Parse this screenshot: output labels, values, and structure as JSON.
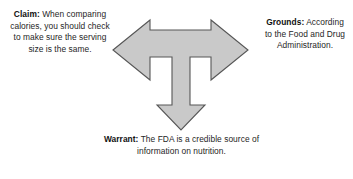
{
  "diagram": {
    "background_color": "#ffffff",
    "arrow": {
      "name": "tri-directional-t-arrow",
      "fill_color": "#c9c9c9",
      "stroke_color": "#565656",
      "directions": [
        "left",
        "right",
        "down"
      ]
    },
    "nodes": {
      "claim": {
        "label": "Claim:",
        "text": " When comparing calories, you should check to make sure the serving size is the same.",
        "full": "Claim: When comparing calories, you should check to make sure the serving size is the same."
      },
      "grounds": {
        "label": "Grounds:",
        "text": " According to the Food and Drug Administration.",
        "full": "Grounds: According to the Food and Drug Administration."
      },
      "warrant": {
        "label": "Warrant:",
        "text": " The FDA is a credible source of information on nutrition.",
        "full": "Warrant: The FDA is a credible source of information on nutrition."
      }
    }
  }
}
